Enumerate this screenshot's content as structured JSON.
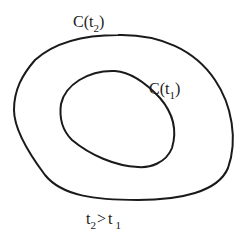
{
  "diagram": {
    "type": "nested-closed-curves",
    "curves": [
      {
        "id": "outer",
        "label": "C(t₂)",
        "base": "C(t",
        "sub": "2",
        "close": ")"
      },
      {
        "id": "inner",
        "label": "C(t₁)",
        "base": "C(t",
        "sub": "1",
        "close": ")"
      }
    ],
    "condition": {
      "text": "t₂ > t₁",
      "left_base": "t",
      "left_sub": "2",
      "op": ">",
      "right_base": "t",
      "right_sub": "1"
    },
    "colors": {
      "stroke": "#1a1a1a",
      "background": "#ffffff"
    }
  }
}
